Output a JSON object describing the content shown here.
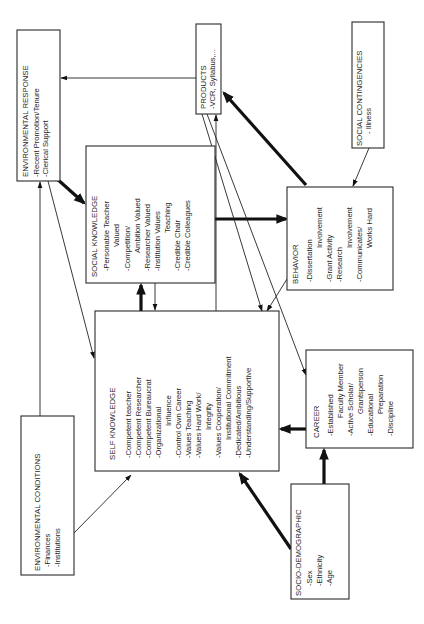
{
  "diagram": {
    "orientation": "rotated-90-ccw",
    "nodes": {
      "environmental_response": {
        "title": "ENVIRONMENTAL RESPONSE",
        "items": [
          "-Recent Promotion/Tenure",
          "-Clerical Support"
        ]
      },
      "products": {
        "title": "PRODUCTS",
        "items": [
          "-VCR, Syllabus,..."
        ]
      },
      "social_contingencies": {
        "title": "SOCIAL CONTINGENCIES",
        "items": [
          "- Illness"
        ]
      },
      "social_knowledge": {
        "title": "SOCIAL KNOWLEDGE",
        "items": [
          "-Personable Teacher",
          "Valued",
          "-Competition/",
          "Ambition Valued",
          "-Researcher Valued",
          "-Institution Values",
          "Teaching",
          "-Credible Chair",
          "-Credible Colleagues"
        ]
      },
      "behavior": {
        "title": "BEHAVIOR",
        "items": [
          "-Dissertation",
          "Involvement",
          "-Grant Activity",
          "-Research",
          "Involvement",
          "-Communicates/",
          "Works Hard"
        ]
      },
      "self_knowledge": {
        "title": "SELF KNOWLEDGE",
        "items": [
          "-Competent teacher",
          "-Competent Researcher",
          "-Competent Bureaucrat",
          "-Organizational",
          "Influence",
          "-Control Own Career",
          "-Values Teaching",
          "-Values Hard Work/",
          "Integrity",
          "-Values Cooperation/",
          "Institutional Commitment",
          "-Dedicated/Ambitious",
          "-Understanding/Supportive"
        ]
      },
      "environmental_conditions": {
        "title": "ENVIRONMENTAL CONDITIONS",
        "items": [
          "-Finances",
          "-Institutions"
        ]
      },
      "career": {
        "title": "CAREER",
        "items": [
          "-Established",
          "Faculty Member",
          "-Active Scholar/",
          "Grantsperson",
          "-Educational",
          "Preparation",
          "-Discipline"
        ]
      },
      "socio_demographic": {
        "title": "SOCIO-DEMOGRAPHIC",
        "items": [
          "-Sex",
          "-Ethnicity",
          "-Age"
        ]
      }
    },
    "edges": [
      {
        "from": "products",
        "to": "environmental_response",
        "weight": "thin"
      },
      {
        "from": "environmental_response",
        "to": "social_knowledge",
        "weight": "thick"
      },
      {
        "from": "environmental_response",
        "to": "self_knowledge",
        "weight": "thin"
      },
      {
        "from": "environmental_conditions",
        "to": "environmental_response",
        "weight": "thin"
      },
      {
        "from": "environmental_conditions",
        "to": "self_knowledge",
        "weight": "thin"
      },
      {
        "from": "self_knowledge",
        "to": "social_knowledge",
        "weight": "thick"
      },
      {
        "from": "social_knowledge",
        "to": "self_knowledge",
        "weight": "thin"
      },
      {
        "from": "social_knowledge",
        "to": "behavior",
        "weight": "thick"
      },
      {
        "from": "behavior",
        "to": "products",
        "weight": "thick"
      },
      {
        "from": "social_contingencies",
        "to": "behavior",
        "weight": "thin"
      },
      {
        "from": "behavior",
        "to": "self_knowledge",
        "weight": "thin"
      },
      {
        "from": "products",
        "to": "self_knowledge",
        "weight": "thin"
      },
      {
        "from": "products",
        "to": "career",
        "weight": "thin"
      },
      {
        "from": "self_knowledge",
        "to": "products",
        "weight": "thin"
      },
      {
        "from": "career",
        "to": "self_knowledge",
        "weight": "thick"
      },
      {
        "from": "socio_demographic",
        "to": "career",
        "weight": "thick"
      },
      {
        "from": "socio_demographic",
        "to": "self_knowledge",
        "weight": "thick"
      }
    ]
  }
}
